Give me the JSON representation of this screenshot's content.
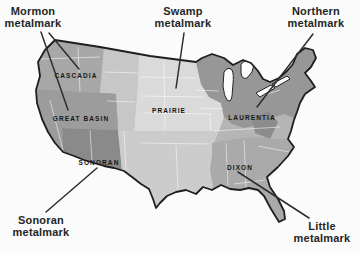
{
  "figure": {
    "background": "#fbfbfb"
  },
  "callouts": [
    {
      "id": "mormon",
      "line1": "Mormon",
      "line2": "metalmark"
    },
    {
      "id": "swamp",
      "line1": "Swamp",
      "line2": "metalmark"
    },
    {
      "id": "northern",
      "line1": "Northern",
      "line2": "metalmark"
    },
    {
      "id": "sonoran",
      "line1": "Sonoran",
      "line2": "metalmark"
    },
    {
      "id": "little",
      "line1": "Little",
      "line2": "metalmark"
    }
  ],
  "map": {
    "outline_color": "#1e1e1e",
    "state_line_color": "#ffffff",
    "water_color": "#fcfcfc",
    "base_color": "#b5b5b5",
    "pointer_color": "#2e2e2e",
    "regions": [
      {
        "label": "CASCADIA",
        "color": "#a7a7a7"
      },
      {
        "label": "GREAT BASIN",
        "color": "#9c9c9c"
      },
      {
        "label": "SONORAN",
        "color": "#8a8a8a"
      },
      {
        "label": "PRAIRIE",
        "color": "#dadada"
      },
      {
        "label": "LAURENTIA",
        "color": "#979797"
      },
      {
        "label": "DIXON",
        "color": "#aaaaaa"
      }
    ],
    "zones": [
      {
        "name": "northern-rockies-band",
        "color": "#c7c7c7"
      },
      {
        "name": "south-central",
        "color": "#cccccc"
      },
      {
        "name": "appalachian-patch",
        "color": "#8c8c8c"
      }
    ]
  }
}
